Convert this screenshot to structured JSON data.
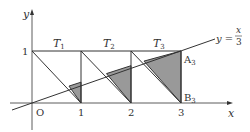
{
  "axes": {
    "x_label": "x",
    "y_label": "y",
    "origin_label": "O",
    "x_ticks": [
      "1",
      "2",
      "3"
    ],
    "y_ticks": [
      "1"
    ]
  },
  "regions": [
    {
      "label": "T",
      "sub": "1"
    },
    {
      "label": "T",
      "sub": "2"
    },
    {
      "label": "T",
      "sub": "3"
    }
  ],
  "line": {
    "label_lhs": "y =",
    "label_num": "x",
    "label_den": "3"
  },
  "points": {
    "A": {
      "label": "A",
      "sub": "3"
    },
    "B": {
      "label": "B",
      "sub": "3"
    }
  },
  "colors": {
    "stroke": "#333333",
    "shade": "#999999"
  }
}
